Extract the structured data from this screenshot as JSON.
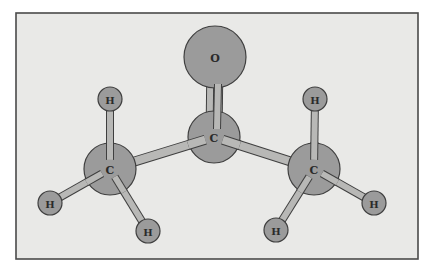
{
  "diagram": {
    "colors": {
      "background": "#ffffff",
      "frame_fill": "#e9e9e7",
      "frame_stroke": "#4a4a4a",
      "atom_fill": "#9b9b9b",
      "bond_fill": "#b8b8b6",
      "outline": "#3f3f3f"
    },
    "frame": {
      "x": 16,
      "y": 13,
      "width": 402,
      "height": 246
    },
    "atoms": [
      {
        "id": "O1",
        "label": "O",
        "cx": 215,
        "cy": 57,
        "r": 31
      },
      {
        "id": "C2",
        "label": "C",
        "cx": 214,
        "cy": 137,
        "r": 26
      },
      {
        "id": "C1",
        "label": "C",
        "cx": 110,
        "cy": 169,
        "r": 26
      },
      {
        "id": "C3",
        "label": "C",
        "cx": 314,
        "cy": 169,
        "r": 26
      },
      {
        "id": "H1a",
        "label": "H",
        "cx": 110,
        "cy": 99,
        "r": 12
      },
      {
        "id": "H1b",
        "label": "H",
        "cx": 50,
        "cy": 203,
        "r": 12
      },
      {
        "id": "H1c",
        "label": "H",
        "cx": 148,
        "cy": 231,
        "r": 12
      },
      {
        "id": "H3a",
        "label": "H",
        "cx": 315,
        "cy": 99,
        "r": 12
      },
      {
        "id": "H3b",
        "label": "H",
        "cx": 374,
        "cy": 203,
        "r": 12
      },
      {
        "id": "H3c",
        "label": "H",
        "cx": 276,
        "cy": 230,
        "r": 12
      }
    ],
    "bonds": [
      {
        "from": "C2",
        "to": "O1",
        "order": 2
      },
      {
        "from": "C2",
        "to": "C1",
        "order": 1
      },
      {
        "from": "C2",
        "to": "C3",
        "order": 1
      },
      {
        "from": "C1",
        "to": "H1a",
        "order": 1
      },
      {
        "from": "C1",
        "to": "H1b",
        "order": 1
      },
      {
        "from": "C1",
        "to": "H1c",
        "order": 1
      },
      {
        "from": "C3",
        "to": "H3a",
        "order": 1
      },
      {
        "from": "C3",
        "to": "H3b",
        "order": 1
      },
      {
        "from": "C3",
        "to": "H3c",
        "order": 1
      }
    ]
  }
}
